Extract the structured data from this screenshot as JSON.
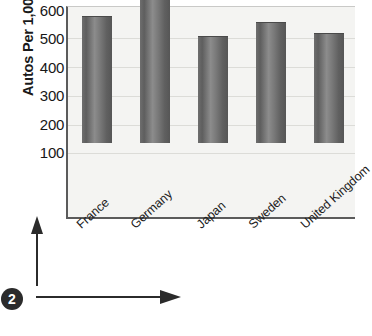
{
  "chart_data": {
    "type": "bar",
    "title": "",
    "xlabel": "",
    "ylabel": "Autos Per 1,000 People",
    "categories": [
      "France",
      "Germany",
      "Japan",
      "Sweden",
      "United Kingdom"
    ],
    "values": [
      441,
      507,
      373,
      420,
      382
    ],
    "ylim": [
      0,
      600
    ],
    "yticks": [
      600,
      500,
      400,
      300,
      200,
      100
    ],
    "ytick_labels": [
      "600",
      "500",
      "400",
      "300",
      "200",
      "100"
    ],
    "grid": true,
    "grid_orientation": "horizontal",
    "legend": null,
    "legend_position": "none",
    "bar_color": "#6e6e6e",
    "plot_background": "#f4f4f2",
    "axis_color": "#5b5b5b",
    "gridline_color": "#dcdcd8"
  },
  "annotations": {
    "step_badge": "2",
    "vertical_arrow": "arrow-up-icon",
    "horizontal_arrow": "arrow-right-icon"
  },
  "caption": {
    "text": ""
  }
}
